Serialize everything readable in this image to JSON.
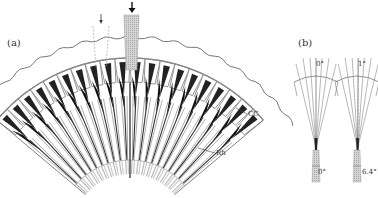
{
  "figure": {
    "panel_a": {
      "label": "(a)",
      "annotations": {
        "cc": "CC",
        "rh": "Rh"
      },
      "unit_count": 20,
      "arrows": [
        {
          "name": "small-arrow",
          "style": "dashed-beam"
        },
        {
          "name": "large-arrow",
          "style": "shaded-beam"
        }
      ]
    },
    "panel_b": {
      "label": "(b)",
      "left_unit": {
        "top_angle": "0°",
        "bottom_angle": "0°"
      },
      "right_unit": {
        "top_angle": "1°",
        "bottom_angle": "6.4°"
      }
    },
    "colors": {
      "ink": "#222222",
      "grey_line": "#888888",
      "shade": "#bdbdbd",
      "background": "#ffffff"
    }
  }
}
